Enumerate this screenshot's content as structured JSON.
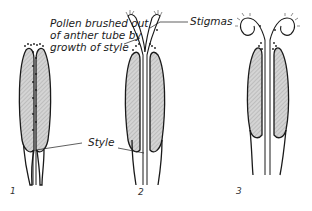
{
  "figure": {
    "annotations": {
      "pollen_line1": "Pollen brushed out",
      "pollen_line2": "of anther tube by",
      "pollen_line3": "growth of style",
      "stigmas": "Stigmas",
      "style": "Style"
    },
    "panel_numbers": [
      "1",
      "2",
      "3"
    ],
    "colors": {
      "outline": "#1a1a1a",
      "anther_fill": "#c8c8c8",
      "background": "#ffffff"
    }
  }
}
